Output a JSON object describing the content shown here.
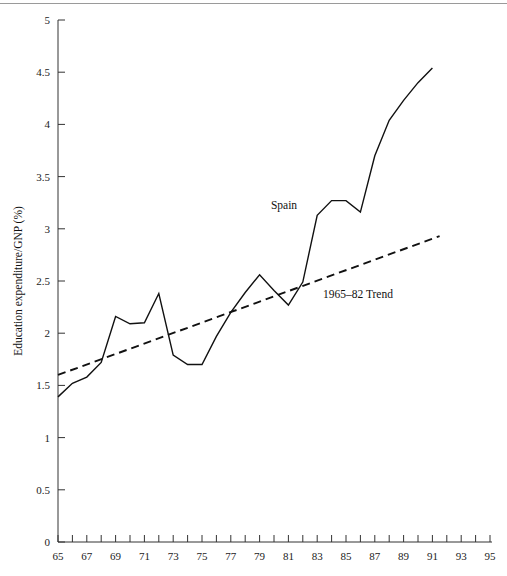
{
  "figure": {
    "background_color": "#ffffff",
    "ink_color": "#1a1a1a",
    "rule_color": "#9a9a9a",
    "has_top_rule": true
  },
  "axes": {
    "y_title": "Education expenditure/GNP (%)",
    "x_title": "",
    "y_ticks": [
      "0",
      "0.5",
      "1",
      "1.5",
      "2",
      "2.5",
      "3",
      "3.5",
      "4",
      "4.5",
      "5"
    ],
    "x_ticks_labeled": [
      "65",
      "67",
      "69",
      "71",
      "73",
      "75",
      "77",
      "79",
      "81",
      "83",
      "85",
      "87",
      "89",
      "91",
      "93",
      "95"
    ]
  },
  "annotations": {
    "series_label": "Spain",
    "trend_label": "1965–82 Trend"
  },
  "chart_data": {
    "type": "line",
    "title": "",
    "xlabel": "",
    "ylabel": "Education expenditure/GNP (%)",
    "xlim": [
      65,
      95
    ],
    "ylim": [
      0,
      5
    ],
    "grid": false,
    "legend": "inline-annotations",
    "x_tick_step": 1,
    "x_tick_label_step": 2,
    "y_tick_step": 0.5,
    "series": [
      {
        "name": "Spain",
        "style": "solid",
        "color": "#111111",
        "x": [
          65,
          66,
          67,
          68,
          69,
          70,
          71,
          72,
          73,
          74,
          75,
          76,
          77,
          78,
          79,
          80,
          81,
          82,
          83,
          84,
          85,
          86,
          87,
          88,
          89,
          90,
          91
        ],
        "values": [
          1.39,
          1.52,
          1.58,
          1.72,
          2.16,
          2.09,
          2.1,
          2.38,
          1.79,
          1.7,
          1.7,
          1.97,
          2.2,
          2.39,
          2.56,
          2.41,
          2.27,
          2.49,
          3.13,
          3.27,
          3.27,
          3.16,
          3.7,
          4.04,
          4.23,
          4.4,
          4.54
        ]
      },
      {
        "name": "1965–82 Trend",
        "style": "dashed",
        "color": "#111111",
        "x": [
          65,
          91.5
        ],
        "values": [
          1.6,
          2.93
        ]
      }
    ]
  }
}
